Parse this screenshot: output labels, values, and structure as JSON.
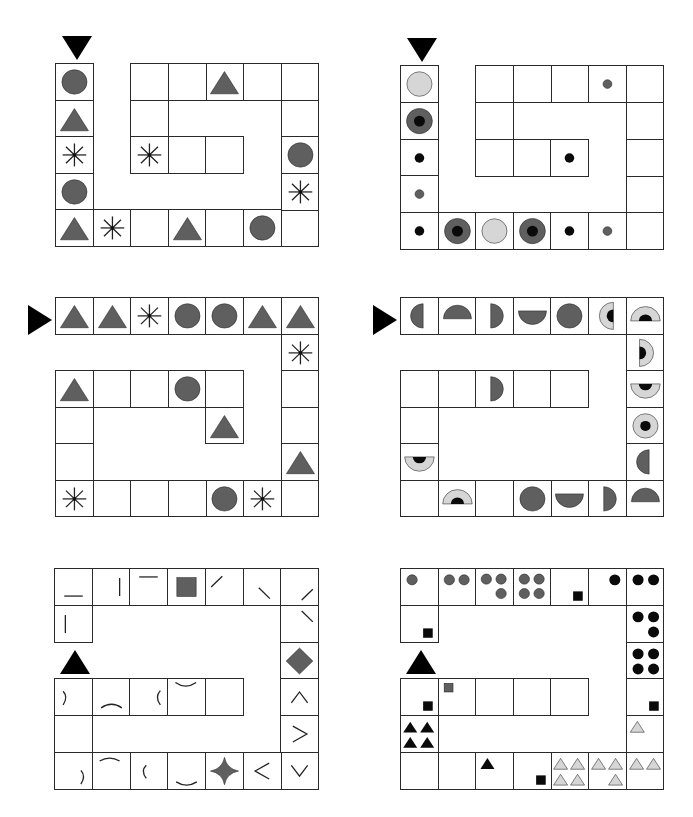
{
  "colors": {
    "dark_gray": "#5f5f5f",
    "light_gray": "#d6d6d6",
    "black": "#0a0a0a",
    "border": "#2a2a2a"
  },
  "panels": [
    {
      "id": "panel-1",
      "x": 55,
      "y": 63,
      "cw": 37.6,
      "ch": 36.6,
      "start_marker": {
        "dir": "down",
        "x": 62,
        "y": 36
      },
      "cells": [
        {
          "c": 0,
          "r": 0,
          "s": "circle"
        },
        {
          "c": 0,
          "r": 1,
          "s": "triangle"
        },
        {
          "c": 0,
          "r": 2,
          "s": "asterisk"
        },
        {
          "c": 0,
          "r": 3,
          "s": "circle"
        },
        {
          "c": 0,
          "r": 4,
          "s": "triangle"
        },
        {
          "c": 1,
          "r": 4,
          "s": "asterisk"
        },
        {
          "c": 2,
          "r": 4,
          "s": ""
        },
        {
          "c": 3,
          "r": 4,
          "s": "triangle"
        },
        {
          "c": 4,
          "r": 4,
          "s": ""
        },
        {
          "c": 5,
          "r": 4,
          "s": "circle"
        },
        {
          "c": 6,
          "r": 4,
          "s": ""
        },
        {
          "c": 6,
          "r": 3,
          "s": "asterisk"
        },
        {
          "c": 6,
          "r": 2,
          "s": "circle"
        },
        {
          "c": 6,
          "r": 1,
          "s": ""
        },
        {
          "c": 6,
          "r": 0,
          "s": ""
        },
        {
          "c": 5,
          "r": 0,
          "s": ""
        },
        {
          "c": 4,
          "r": 0,
          "s": "triangle"
        },
        {
          "c": 3,
          "r": 0,
          "s": ""
        },
        {
          "c": 2,
          "r": 0,
          "s": ""
        },
        {
          "c": 2,
          "r": 1,
          "s": ""
        },
        {
          "c": 2,
          "r": 2,
          "s": "asterisk"
        },
        {
          "c": 3,
          "r": 2,
          "s": ""
        },
        {
          "c": 4,
          "r": 2,
          "s": ""
        }
      ],
      "offsets": {
        "inner_shift_y": 2
      }
    },
    {
      "id": "panel-2",
      "x": 400,
      "y": 65,
      "cw": 37.6,
      "ch": 36.8,
      "start_marker": {
        "dir": "down",
        "x": 407,
        "y": 38
      },
      "cells": [
        {
          "c": 0,
          "r": 0,
          "s": "circle-light"
        },
        {
          "c": 0,
          "r": 1,
          "s": "ring-dark"
        },
        {
          "c": 0,
          "r": 2,
          "s": "dot-black"
        },
        {
          "c": 0,
          "r": 3,
          "s": "dot-gray"
        },
        {
          "c": 0,
          "r": 4,
          "s": "dot-black"
        },
        {
          "c": 1,
          "r": 4,
          "s": "ring-dark"
        },
        {
          "c": 2,
          "r": 4,
          "s": "circle-light"
        },
        {
          "c": 3,
          "r": 4,
          "s": "ring-dark"
        },
        {
          "c": 4,
          "r": 4,
          "s": "dot-black"
        },
        {
          "c": 5,
          "r": 4,
          "s": "dot-gray"
        },
        {
          "c": 6,
          "r": 4,
          "s": ""
        },
        {
          "c": 6,
          "r": 3,
          "s": ""
        },
        {
          "c": 6,
          "r": 2,
          "s": ""
        },
        {
          "c": 6,
          "r": 1,
          "s": ""
        },
        {
          "c": 6,
          "r": 0,
          "s": ""
        },
        {
          "c": 5,
          "r": 0,
          "s": "dot-gray"
        },
        {
          "c": 4,
          "r": 0,
          "s": ""
        },
        {
          "c": 3,
          "r": 0,
          "s": ""
        },
        {
          "c": 2,
          "r": 0,
          "s": ""
        },
        {
          "c": 2,
          "r": 1,
          "s": ""
        },
        {
          "c": 2,
          "r": 2,
          "s": ""
        },
        {
          "c": 3,
          "r": 2,
          "s": ""
        },
        {
          "c": 4,
          "r": 2,
          "s": "dot-black"
        }
      ]
    },
    {
      "id": "panel-3",
      "x": 55,
      "y": 297,
      "cw": 37.6,
      "ch": 36.5,
      "start_marker": {
        "dir": "right",
        "x": 28,
        "y": 305
      },
      "cells": [
        {
          "c": 0,
          "r": 0,
          "s": "triangle"
        },
        {
          "c": 1,
          "r": 0,
          "s": "triangle"
        },
        {
          "c": 2,
          "r": 0,
          "s": "asterisk"
        },
        {
          "c": 3,
          "r": 0,
          "s": "circle"
        },
        {
          "c": 4,
          "r": 0,
          "s": "circle"
        },
        {
          "c": 5,
          "r": 0,
          "s": "triangle"
        },
        {
          "c": 6,
          "r": 0,
          "s": "triangle"
        },
        {
          "c": 6,
          "r": 1,
          "s": "asterisk"
        },
        {
          "c": 6,
          "r": 2,
          "s": ""
        },
        {
          "c": 6,
          "r": 3,
          "s": ""
        },
        {
          "c": 6,
          "r": 4,
          "s": "triangle"
        },
        {
          "c": 6,
          "r": 5,
          "s": ""
        },
        {
          "c": 5,
          "r": 5,
          "s": "asterisk"
        },
        {
          "c": 4,
          "r": 5,
          "s": "circle"
        },
        {
          "c": 3,
          "r": 5,
          "s": ""
        },
        {
          "c": 2,
          "r": 5,
          "s": ""
        },
        {
          "c": 1,
          "r": 5,
          "s": ""
        },
        {
          "c": 0,
          "r": 5,
          "s": "asterisk"
        },
        {
          "c": 0,
          "r": 4,
          "s": ""
        },
        {
          "c": 0,
          "r": 3,
          "s": ""
        },
        {
          "c": 0,
          "r": 2,
          "s": "triangle"
        },
        {
          "c": 1,
          "r": 2,
          "s": ""
        },
        {
          "c": 2,
          "r": 2,
          "s": ""
        },
        {
          "c": 3,
          "r": 2,
          "s": "circle"
        },
        {
          "c": 4,
          "r": 2,
          "s": ""
        },
        {
          "c": 4,
          "r": 3,
          "s": "triangle"
        }
      ]
    },
    {
      "id": "panel-4",
      "x": 400,
      "y": 297,
      "cw": 37.6,
      "ch": 36.5,
      "start_marker": {
        "dir": "right",
        "x": 373,
        "y": 305
      },
      "cells": [
        {
          "c": 0,
          "r": 0,
          "s": "half-left"
        },
        {
          "c": 1,
          "r": 0,
          "s": "half-up"
        },
        {
          "c": 2,
          "r": 0,
          "s": "half-right"
        },
        {
          "c": 3,
          "r": 0,
          "s": "half-down"
        },
        {
          "c": 4,
          "r": 0,
          "s": "circle"
        },
        {
          "c": 5,
          "r": 0,
          "s": "halfring-left"
        },
        {
          "c": 6,
          "r": 0,
          "s": "halfring-up"
        },
        {
          "c": 6,
          "r": 1,
          "s": "halfring-right"
        },
        {
          "c": 6,
          "r": 2,
          "s": "halfring-down"
        },
        {
          "c": 6,
          "r": 3,
          "s": "ring-light"
        },
        {
          "c": 6,
          "r": 4,
          "s": "half-left"
        },
        {
          "c": 6,
          "r": 5,
          "s": "half-up"
        },
        {
          "c": 5,
          "r": 5,
          "s": "half-right"
        },
        {
          "c": 4,
          "r": 5,
          "s": "half-down"
        },
        {
          "c": 3,
          "r": 5,
          "s": "circle"
        },
        {
          "c": 2,
          "r": 5,
          "s": ""
        },
        {
          "c": 1,
          "r": 5,
          "s": "halfring-up"
        },
        {
          "c": 0,
          "r": 5,
          "s": ""
        },
        {
          "c": 0,
          "r": 4,
          "s": "halfring-down"
        },
        {
          "c": 0,
          "r": 3,
          "s": ""
        },
        {
          "c": 0,
          "r": 2,
          "s": ""
        },
        {
          "c": 1,
          "r": 2,
          "s": ""
        },
        {
          "c": 2,
          "r": 2,
          "s": "half-right"
        },
        {
          "c": 3,
          "r": 2,
          "s": ""
        },
        {
          "c": 4,
          "r": 2,
          "s": ""
        }
      ]
    },
    {
      "id": "panel-5",
      "x": 54,
      "y": 568,
      "cw": 37.7,
      "ch": 36.8,
      "start_marker": {
        "dir": "up",
        "x": 60,
        "y": 650
      },
      "cells": [
        {
          "c": 0,
          "r": 1,
          "s": "line-v-left"
        },
        {
          "c": 0,
          "r": 0,
          "s": "line-h-bottom"
        },
        {
          "c": 1,
          "r": 0,
          "s": "line-v-right"
        },
        {
          "c": 2,
          "r": 0,
          "s": "line-h-top"
        },
        {
          "c": 3,
          "r": 0,
          "s": "square"
        },
        {
          "c": 4,
          "r": 0,
          "s": "line-slash-tl"
        },
        {
          "c": 5,
          "r": 0,
          "s": "line-back-bl"
        },
        {
          "c": 6,
          "r": 0,
          "s": "line-slash-br"
        },
        {
          "c": 6,
          "r": 1,
          "s": "line-back-tr"
        },
        {
          "c": 6,
          "r": 2,
          "s": "diamond"
        },
        {
          "c": 6,
          "r": 3,
          "s": "chev-up"
        },
        {
          "c": 6,
          "r": 4,
          "s": "chev-right"
        },
        {
          "c": 6,
          "r": 5,
          "s": "chev-down"
        },
        {
          "c": 5,
          "r": 5,
          "s": "chev-left"
        },
        {
          "c": 4,
          "r": 5,
          "s": "star4"
        },
        {
          "c": 3,
          "r": 5,
          "s": "arc-smile-bottom"
        },
        {
          "c": 2,
          "r": 5,
          "s": "arc-paren-left"
        },
        {
          "c": 1,
          "r": 5,
          "s": "arc-frown-top"
        },
        {
          "c": 0,
          "r": 5,
          "s": "arc-paren-right-r"
        },
        {
          "c": 0,
          "r": 4,
          "s": ""
        },
        {
          "c": 0,
          "r": 3,
          "s": "arc-paren-right-l"
        },
        {
          "c": 1,
          "r": 3,
          "s": "arc-frown-bottom"
        },
        {
          "c": 2,
          "r": 3,
          "s": "arc-paren-left-r"
        },
        {
          "c": 3,
          "r": 3,
          "s": "arc-smile-top"
        },
        {
          "c": 4,
          "r": 3,
          "s": ""
        }
      ]
    },
    {
      "id": "panel-6",
      "x": 400,
      "y": 568,
      "cw": 37.6,
      "ch": 36.8,
      "start_marker": {
        "dir": "up",
        "x": 406,
        "y": 650
      },
      "cells": [
        {
          "c": 0,
          "r": 1,
          "s": "sq-br"
        },
        {
          "c": 0,
          "r": 0,
          "s": "g1"
        },
        {
          "c": 1,
          "r": 0,
          "s": "g2"
        },
        {
          "c": 2,
          "r": 0,
          "s": "g3"
        },
        {
          "c": 3,
          "r": 0,
          "s": "g4"
        },
        {
          "c": 4,
          "r": 0,
          "s": "sq-br"
        },
        {
          "c": 5,
          "r": 0,
          "s": "b1"
        },
        {
          "c": 6,
          "r": 0,
          "s": "b2"
        },
        {
          "c": 6,
          "r": 1,
          "s": "b3"
        },
        {
          "c": 6,
          "r": 2,
          "s": "b4"
        },
        {
          "c": 6,
          "r": 3,
          "s": "sq-br"
        },
        {
          "c": 6,
          "r": 4,
          "s": "lt1"
        },
        {
          "c": 6,
          "r": 5,
          "s": "lt2"
        },
        {
          "c": 5,
          "r": 5,
          "s": "lt3"
        },
        {
          "c": 4,
          "r": 5,
          "s": "lt4"
        },
        {
          "c": 3,
          "r": 5,
          "s": "sq-br"
        },
        {
          "c": 2,
          "r": 5,
          "s": "bt1"
        },
        {
          "c": 1,
          "r": 5,
          "s": ""
        },
        {
          "c": 0,
          "r": 5,
          "s": ""
        },
        {
          "c": 0,
          "r": 4,
          "s": "bt4"
        },
        {
          "c": 0,
          "r": 3,
          "s": "sq-br"
        },
        {
          "c": 1,
          "r": 3,
          "s": "gsq-tl"
        },
        {
          "c": 2,
          "r": 3,
          "s": ""
        },
        {
          "c": 3,
          "r": 3,
          "s": ""
        },
        {
          "c": 4,
          "r": 3,
          "s": ""
        }
      ]
    }
  ]
}
